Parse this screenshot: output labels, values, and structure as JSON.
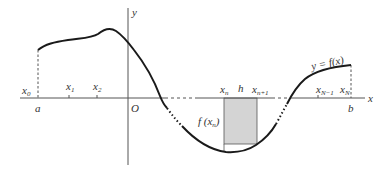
{
  "figure": {
    "curve_label": "y = f(x)",
    "axes": {
      "x_label": "x",
      "y_label": "y",
      "origin_label": "O"
    },
    "interval": {
      "left_label": "a",
      "right_label": "b"
    },
    "nodes": [
      {
        "base": "x",
        "sub": "0"
      },
      {
        "base": "x",
        "sub": "1"
      },
      {
        "base": "x",
        "sub": "2"
      },
      {
        "base": "x",
        "sub": "n"
      },
      {
        "base": "x",
        "sub": "n+1"
      },
      {
        "base": "x",
        "sub": "N−1"
      },
      {
        "base": "x",
        "sub": "N"
      }
    ],
    "step_label": "h",
    "height_label": {
      "pre": "f (x",
      "sub": "n",
      "post": ")"
    },
    "colors": {
      "curve": "#1a1a1a",
      "axis": "#555555",
      "shaded_rect": "#d4d4d4",
      "text": "#333333"
    }
  }
}
